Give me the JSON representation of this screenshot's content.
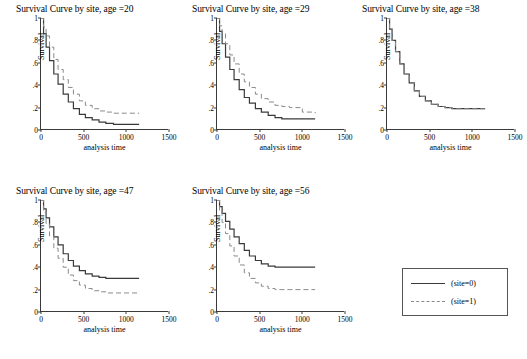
{
  "chart_data": {
    "type": "line",
    "layout": "small-multiples",
    "shared": {
      "xlabel": "analysis time",
      "ylabel": "Survival",
      "xlim": [
        0,
        1500
      ],
      "ylim": [
        0,
        1
      ],
      "xticks": [
        0,
        500,
        1000,
        1500
      ],
      "yticks": [
        0,
        0.2,
        0.4,
        0.6,
        0.8,
        1
      ],
      "ytick_labels": [
        "0",
        ".2",
        ".4",
        ".6",
        ".8",
        "1"
      ],
      "xtick_labels": [
        "0",
        "500",
        "1000",
        "1500"
      ],
      "grid": false,
      "legend_position": "bottom-right",
      "series_names": [
        "(site=0)",
        "(site=1)"
      ],
      "series_styles": [
        "solid",
        "dashed"
      ]
    },
    "legend": {
      "entries": [
        {
          "label": "(site=0)",
          "style": "solid"
        },
        {
          "label": "(site=1)",
          "style": "dashed"
        }
      ]
    },
    "panels": [
      {
        "title": "Survival Curve by site, age =20",
        "series": [
          {
            "name": "(site=0)",
            "style": "solid",
            "x": [
              0,
              30,
              60,
              100,
              150,
              200,
              260,
              320,
              380,
              450,
              520,
              600,
              680,
              760,
              850,
              1000,
              1150
            ],
            "y": [
              1.0,
              0.86,
              0.74,
              0.62,
              0.5,
              0.41,
              0.32,
              0.25,
              0.19,
              0.14,
              0.11,
              0.09,
              0.07,
              0.06,
              0.05,
              0.05,
              0.05
            ]
          },
          {
            "name": "(site=1)",
            "style": "dashed",
            "x": [
              0,
              30,
              60,
              100,
              150,
              200,
              260,
              320,
              380,
              450,
              520,
              600,
              680,
              760,
              850,
              1000,
              1150
            ],
            "y": [
              1.0,
              0.92,
              0.84,
              0.74,
              0.63,
              0.54,
              0.45,
              0.38,
              0.32,
              0.26,
              0.22,
              0.19,
              0.17,
              0.16,
              0.15,
              0.15,
              0.15
            ]
          }
        ]
      },
      {
        "title": "Survival Curve by site, age =29",
        "series": [
          {
            "name": "(site=0)",
            "style": "solid",
            "x": [
              0,
              30,
              60,
              100,
              150,
              200,
              260,
              320,
              380,
              450,
              520,
              600,
              680,
              760,
              850,
              1000,
              1150
            ],
            "y": [
              1.0,
              0.88,
              0.77,
              0.65,
              0.54,
              0.45,
              0.36,
              0.29,
              0.24,
              0.19,
              0.16,
              0.13,
              0.11,
              0.1,
              0.1,
              0.1,
              0.1
            ]
          },
          {
            "name": "(site=1)",
            "style": "dashed",
            "x": [
              0,
              30,
              60,
              100,
              150,
              200,
              260,
              320,
              380,
              450,
              520,
              600,
              680,
              760,
              850,
              1000,
              1150
            ],
            "y": [
              1.0,
              0.93,
              0.86,
              0.77,
              0.67,
              0.59,
              0.5,
              0.43,
              0.38,
              0.32,
              0.28,
              0.25,
              0.22,
              0.21,
              0.2,
              0.16,
              0.15
            ]
          }
        ]
      },
      {
        "title": "Survival Curve by site, age =38",
        "series": [
          {
            "name": "(site=0)",
            "style": "solid",
            "x": [
              0,
              30,
              60,
              100,
              150,
              200,
              260,
              320,
              380,
              450,
              520,
              600,
              680,
              760,
              850,
              1000,
              1150
            ],
            "y": [
              1.0,
              0.9,
              0.8,
              0.7,
              0.59,
              0.5,
              0.42,
              0.35,
              0.3,
              0.26,
              0.23,
              0.21,
              0.2,
              0.19,
              0.19,
              0.19,
              0.19
            ]
          },
          {
            "name": "(site=1)",
            "style": "dashed",
            "x": [
              0,
              30,
              60,
              100,
              150,
              200,
              260,
              320,
              380,
              450,
              520,
              600,
              680,
              760,
              850,
              1000,
              1150
            ],
            "y": [
              1.0,
              0.9,
              0.8,
              0.7,
              0.59,
              0.5,
              0.42,
              0.35,
              0.3,
              0.26,
              0.23,
              0.21,
              0.2,
              0.19,
              0.19,
              0.19,
              0.19
            ]
          }
        ]
      },
      {
        "title": "Survival Curve by site, age =47",
        "series": [
          {
            "name": "(site=0)",
            "style": "solid",
            "x": [
              0,
              30,
              60,
              100,
              150,
              200,
              260,
              320,
              380,
              450,
              520,
              600,
              680,
              760,
              850,
              1000,
              1150
            ],
            "y": [
              1.0,
              0.92,
              0.84,
              0.76,
              0.67,
              0.6,
              0.52,
              0.46,
              0.41,
              0.37,
              0.34,
              0.32,
              0.31,
              0.3,
              0.3,
              0.3,
              0.3
            ]
          },
          {
            "name": "(site=1)",
            "style": "dashed",
            "x": [
              0,
              30,
              60,
              100,
              150,
              200,
              260,
              320,
              380,
              450,
              520,
              600,
              680,
              760,
              850,
              1000,
              1150
            ],
            "y": [
              1.0,
              0.89,
              0.79,
              0.68,
              0.57,
              0.48,
              0.4,
              0.33,
              0.28,
              0.24,
              0.21,
              0.19,
              0.18,
              0.17,
              0.17,
              0.17,
              0.17
            ]
          }
        ]
      },
      {
        "title": "Survival Curve by site, age =56",
        "series": [
          {
            "name": "(site=0)",
            "style": "solid",
            "x": [
              0,
              30,
              60,
              100,
              150,
              200,
              260,
              320,
              380,
              450,
              520,
              600,
              680,
              760,
              850,
              1000,
              1150
            ],
            "y": [
              1.0,
              0.94,
              0.88,
              0.81,
              0.74,
              0.67,
              0.61,
              0.55,
              0.5,
              0.46,
              0.43,
              0.41,
              0.4,
              0.4,
              0.4,
              0.4,
              0.4
            ]
          },
          {
            "name": "(site=1)",
            "style": "dashed",
            "x": [
              0,
              30,
              60,
              100,
              150,
              200,
              260,
              320,
              380,
              450,
              520,
              600,
              680,
              760,
              850,
              1000,
              1150
            ],
            "y": [
              1.0,
              0.9,
              0.8,
              0.7,
              0.59,
              0.5,
              0.42,
              0.35,
              0.3,
              0.26,
              0.23,
              0.21,
              0.2,
              0.2,
              0.2,
              0.2,
              0.2
            ]
          }
        ]
      }
    ]
  },
  "colors": {
    "site0_line": "#3a3a3a",
    "site1_line": "#8a8a8a",
    "axis": "#3a3a3a",
    "background": "#ffffff"
  }
}
